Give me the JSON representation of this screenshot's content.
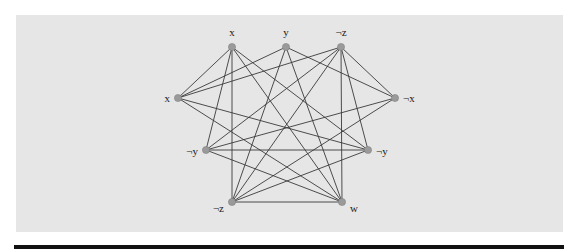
{
  "diagram": {
    "type": "graph",
    "background_color": "#e6e6e6",
    "edge_color": "#3a3a3a",
    "node_color": "#9a9a9a",
    "nodes": [
      {
        "id": "x_top",
        "label": "x",
        "x": 232,
        "y": 47,
        "lx": 232,
        "ly": 36,
        "anchor": "middle"
      },
      {
        "id": "y_top",
        "label": "y",
        "x": 286,
        "y": 47,
        "lx": 286,
        "ly": 36,
        "anchor": "middle"
      },
      {
        "id": "nz_top",
        "label": "¬z",
        "x": 341,
        "y": 47,
        "lx": 341,
        "ly": 36,
        "anchor": "middle"
      },
      {
        "id": "x_left",
        "label": "x",
        "x": 178,
        "y": 98,
        "lx": 170,
        "ly": 102,
        "anchor": "end"
      },
      {
        "id": "nx_right",
        "label": "¬x",
        "x": 395,
        "y": 98,
        "lx": 403,
        "ly": 102,
        "anchor": "start"
      },
      {
        "id": "ny_left",
        "label": "¬y",
        "x": 206,
        "y": 150,
        "lx": 198,
        "ly": 155,
        "anchor": "end"
      },
      {
        "id": "ny_right",
        "label": "¬y",
        "x": 368,
        "y": 150,
        "lx": 376,
        "ly": 155,
        "anchor": "start"
      },
      {
        "id": "nz_bot",
        "label": "¬z",
        "x": 232,
        "y": 202,
        "lx": 224,
        "ly": 212,
        "anchor": "end"
      },
      {
        "id": "w_bot",
        "label": "w",
        "x": 342,
        "y": 202,
        "lx": 350,
        "ly": 212,
        "anchor": "start"
      }
    ],
    "edges": [
      [
        "x_top",
        "x_left"
      ],
      [
        "x_top",
        "ny_left"
      ],
      [
        "x_top",
        "nz_bot"
      ],
      [
        "x_top",
        "w_bot"
      ],
      [
        "x_top",
        "ny_right"
      ],
      [
        "y_top",
        "x_left"
      ],
      [
        "y_top",
        "nz_bot"
      ],
      [
        "y_top",
        "w_bot"
      ],
      [
        "y_top",
        "nx_right"
      ],
      [
        "nz_top",
        "x_left"
      ],
      [
        "nz_top",
        "nx_right"
      ],
      [
        "nz_top",
        "ny_left"
      ],
      [
        "nz_top",
        "nz_bot"
      ],
      [
        "nz_top",
        "w_bot"
      ],
      [
        "nz_top",
        "ny_right"
      ],
      [
        "x_left",
        "ny_right"
      ],
      [
        "x_left",
        "w_bot"
      ],
      [
        "nx_right",
        "ny_left"
      ],
      [
        "nx_right",
        "nz_bot"
      ],
      [
        "ny_left",
        "ny_right"
      ],
      [
        "ny_left",
        "w_bot"
      ],
      [
        "ny_right",
        "nz_bot"
      ],
      [
        "nz_bot",
        "w_bot"
      ]
    ]
  }
}
